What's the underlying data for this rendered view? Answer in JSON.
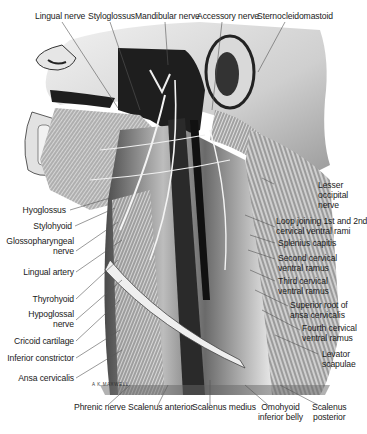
{
  "figure": {
    "artist_signature": "A K MAXWELL",
    "colors": {
      "background": "#ffffff",
      "label_text": "#1a1a1a",
      "leader_line": "#555555",
      "skin_light": "#d9d9d9",
      "muscle_mid": "#8c8c8c",
      "dark_shadow": "#1e1e1e"
    },
    "labels_top": [
      {
        "text": "Lingual nerve"
      },
      {
        "text": "Styloglossus"
      },
      {
        "text": "Mandibular nerve"
      },
      {
        "text": "Accessory nerve"
      },
      {
        "text": "Sternocleidomastoid"
      }
    ],
    "labels_left": [
      {
        "text": "Hyoglossus"
      },
      {
        "text": "Stylohyoid"
      },
      {
        "line1": "Glossopharyngeal",
        "line2": "nerve"
      },
      {
        "text": "Lingual artery"
      },
      {
        "text": "Thyrohyoid"
      },
      {
        "line1": "Hypoglossal",
        "line2": "nerve"
      },
      {
        "text": "Cricoid cartilage"
      },
      {
        "text": "Inferior constrictor"
      },
      {
        "text": "Ansa cervicalis"
      }
    ],
    "labels_right": [
      {
        "line1": "Lesser",
        "line2": "occipital",
        "line3": "nerve"
      },
      {
        "line1": "Loop joining 1st and 2nd",
        "line2": "cervical ventral rami"
      },
      {
        "text": "Splenius capitis"
      },
      {
        "line1": "Second cervical",
        "line2": "ventral ramus"
      },
      {
        "line1": "Third cervical",
        "line2": "ventral ramus"
      },
      {
        "line1": "Superior root of",
        "line2": "ansa cervicalis"
      },
      {
        "line1": "Fourth cervical",
        "line2": "ventral ramus"
      },
      {
        "line1": "Levator",
        "line2": "scapulae"
      }
    ],
    "labels_bottom": [
      {
        "text": "Phrenic nerve"
      },
      {
        "text": "Scalenus anterior"
      },
      {
        "text": "Scalenus medius"
      },
      {
        "line1": "Omohyoid",
        "line2": "inferior belly"
      },
      {
        "line1": "Scalenus",
        "line2": "posterior"
      }
    ]
  }
}
